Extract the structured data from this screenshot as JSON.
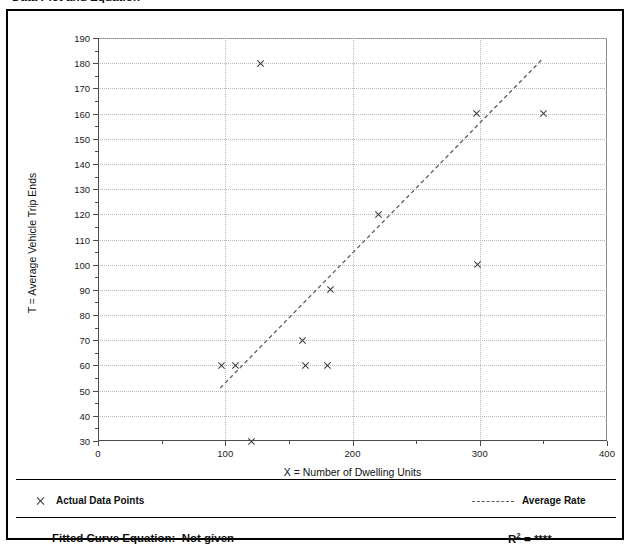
{
  "page": {
    "title": "Data Plot and Equation"
  },
  "chart_data": {
    "type": "scatter",
    "title": "Data Plot and Equation",
    "xlabel": "X = Number of Dwelling Units",
    "ylabel": "T = Average Vehicle Trip Ends",
    "xlim": [
      0,
      400
    ],
    "ylim": [
      30,
      190
    ],
    "xticks": [
      0,
      100,
      200,
      300,
      400
    ],
    "xticks_minor_step": 50,
    "yticks": [
      30,
      40,
      50,
      60,
      70,
      80,
      90,
      100,
      110,
      120,
      130,
      140,
      150,
      160,
      170,
      180,
      190
    ],
    "yticks_minor_step": 5,
    "grid": true,
    "series": [
      {
        "name": "Actual Data Points",
        "type": "scatter",
        "marker": "x",
        "color": "#3a3a3a",
        "points": [
          {
            "x": 97,
            "y": 60
          },
          {
            "x": 108,
            "y": 60
          },
          {
            "x": 120,
            "y": 30
          },
          {
            "x": 127,
            "y": 180
          },
          {
            "x": 160,
            "y": 70
          },
          {
            "x": 163,
            "y": 60
          },
          {
            "x": 180,
            "y": 60
          },
          {
            "x": 182,
            "y": 90
          },
          {
            "x": 220,
            "y": 120
          },
          {
            "x": 297,
            "y": 160
          },
          {
            "x": 298,
            "y": 100
          },
          {
            "x": 350,
            "y": 160
          }
        ]
      },
      {
        "name": "Average Rate",
        "type": "line",
        "style": "dashed",
        "color": "#5d5d5d",
        "points": [
          {
            "x": 96,
            "y": 51
          },
          {
            "x": 350,
            "y": 182
          }
        ]
      }
    ],
    "legend": {
      "position": "below-plot",
      "entries": [
        {
          "label": "Actual Data Points",
          "marker": "x"
        },
        {
          "label": "Average Rate",
          "marker": "dashed-line"
        }
      ]
    },
    "annotations": {
      "equation_label": "Fitted Curve Equation:",
      "equation_value": "Not given",
      "r_squared_label": "R",
      "r_squared_exponent": "2",
      "r_squared_value": "= ****"
    }
  }
}
